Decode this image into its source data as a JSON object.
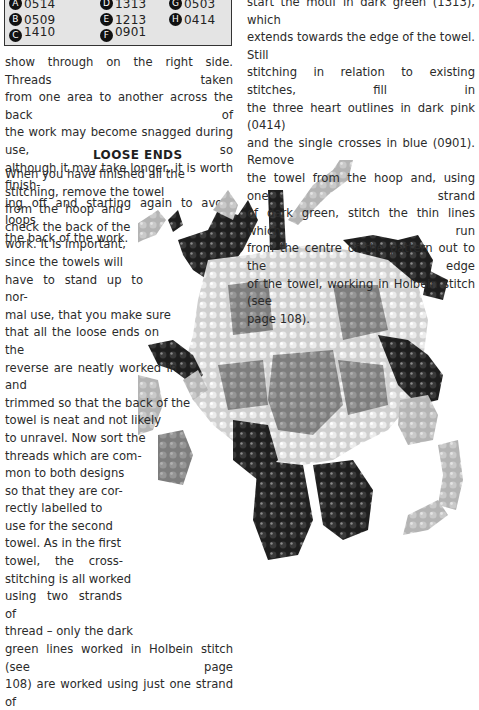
{
  "key": {
    "items": [
      {
        "letter": "A",
        "code": "0514"
      },
      {
        "letter": "B",
        "code": "0509"
      },
      {
        "letter": "C",
        "code": "1410"
      },
      {
        "letter": "D",
        "code": "1313"
      },
      {
        "letter": "E",
        "code": "1213"
      },
      {
        "letter": "F",
        "code": "0901"
      },
      {
        "letter": "G",
        "code": "0503"
      },
      {
        "letter": "H",
        "code": "0414"
      }
    ]
  },
  "left_column": {
    "top_lines": [
      "show through on the right side. Threads taken",
      "from one area to another across the back of",
      "the work may become snagged during use, so",
      "although it may take longer, it is worth finish-",
      "ing off and starting again to avoid loops on",
      "the back of the work."
    ],
    "heading": "LOOSE ENDS",
    "body_lines": [
      "When you have finished all the",
      "stitching, remove the towel",
      "from the hoop and",
      "check the back of the",
      "work. It is important,",
      "since the towels will",
      "have to stand up to nor-",
      "mal use, that you make sure",
      "that all the loose ends on the",
      "reverse are neatly worked in and",
      "trimmed so that the back of the",
      "towel is neat and not likely",
      "to unravel. Now sort the",
      "threads which are com-",
      "mon to both designs",
      "so that they are cor-",
      "rectly labelled to",
      "use for the second",
      "towel. As in the first",
      "towel, the cross-",
      "stitching is all worked",
      "using two strands of",
      "thread – only the dark",
      "green lines worked in Holbein stitch (see page",
      "108) are worked using just one strand of"
    ]
  },
  "right_column": {
    "lines": [
      "start the motif in dark green (1313), which",
      "extends towards the edge of the towel. Still",
      "stitching in relation to existing stitches, fill in",
      "the three heart outlines in dark pink (0414)",
      "and the single crosses in blue (0901). Remove",
      "the towel from the hoop and, using one strand",
      "of dark green, stitch the thin lines which run",
      "from the centre of the pattern out to the edge",
      "of the towel, working in Holbein stitch (see",
      "page 108)."
    ]
  }
}
